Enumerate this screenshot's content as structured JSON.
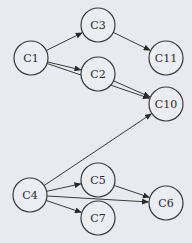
{
  "diagram": {
    "type": "directed-graph",
    "background": "#e9e9f1",
    "node_radius": 17,
    "nodes": [
      {
        "id": "C1",
        "label": "C1",
        "x": 31,
        "y": 58
      },
      {
        "id": "C3",
        "label": "C3",
        "x": 98,
        "y": 25
      },
      {
        "id": "C11",
        "label": "C11",
        "x": 166,
        "y": 58
      },
      {
        "id": "C2",
        "label": "C2",
        "x": 98,
        "y": 74
      },
      {
        "id": "C10",
        "label": "C10",
        "x": 166,
        "y": 104
      },
      {
        "id": "C4",
        "label": "C4",
        "x": 30,
        "y": 195
      },
      {
        "id": "C5",
        "label": "C5",
        "x": 98,
        "y": 180
      },
      {
        "id": "C6",
        "label": "C6",
        "x": 166,
        "y": 203
      },
      {
        "id": "C7",
        "label": "C7",
        "x": 98,
        "y": 218
      }
    ],
    "edges": [
      {
        "from": "C1",
        "to": "C3"
      },
      {
        "from": "C1",
        "to": "C2"
      },
      {
        "from": "C1",
        "to": "C10"
      },
      {
        "from": "C3",
        "to": "C11"
      },
      {
        "from": "C2",
        "to": "C10"
      },
      {
        "from": "C4",
        "to": "C10"
      },
      {
        "from": "C4",
        "to": "C5"
      },
      {
        "from": "C4",
        "to": "C6"
      },
      {
        "from": "C4",
        "to": "C7"
      },
      {
        "from": "C5",
        "to": "C6"
      }
    ]
  }
}
